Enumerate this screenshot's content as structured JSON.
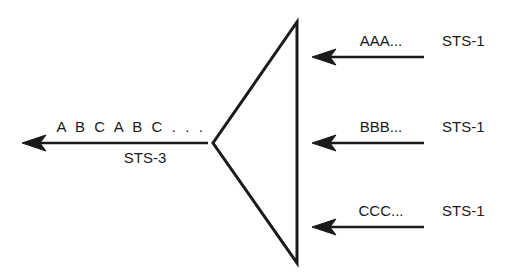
{
  "diagram": {
    "type": "multiplexer-block-diagram",
    "background_color": "#ffffff",
    "line_color": "#1a1a1a",
    "mux": {
      "name": "multiplexer-triangle",
      "shape": "left-pointing-triangle",
      "apex": [
        213,
        143
      ],
      "top_right": [
        297,
        22
      ],
      "bottom_right": [
        297,
        263
      ]
    },
    "output": {
      "signal_label": "A B C A B C . . .",
      "rate_label": "STS-3",
      "arrow_direction": "left",
      "line_y": 143,
      "tail_x": 208,
      "tip_x": 22
    },
    "inputs": [
      {
        "signal_label": "AAA...",
        "rate_label": "STS-1",
        "arrow_direction": "left",
        "line_y": 57,
        "tail_x": 424,
        "tip_x": 312
      },
      {
        "signal_label": "BBB...",
        "rate_label": "STS-1",
        "arrow_direction": "left",
        "line_y": 143,
        "tail_x": 424,
        "tip_x": 312
      },
      {
        "signal_label": "CCC...",
        "rate_label": "STS-1",
        "arrow_direction": "left",
        "line_y": 227,
        "tail_x": 424,
        "tip_x": 312
      }
    ]
  }
}
